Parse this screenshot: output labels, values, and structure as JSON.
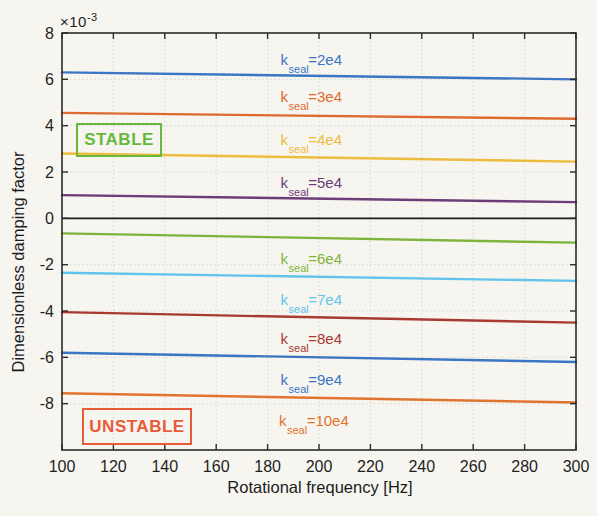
{
  "figure": {
    "background": "#f6f5f0"
  },
  "chart_data": {
    "type": "line",
    "title": "",
    "xlabel": "Rotational frequency [Hz]",
    "ylabel": "Dimensionless damping factor",
    "y_multiplier": {
      "base": "×10",
      "exp": "-3"
    },
    "y_units_note": "all y values are ×10^-3",
    "xlim": [
      100,
      300
    ],
    "ylim": [
      -10,
      8
    ],
    "xticks": [
      100,
      120,
      140,
      160,
      180,
      200,
      220,
      240,
      260,
      280,
      300
    ],
    "yticks": [
      -8,
      -6,
      -4,
      -2,
      0,
      2,
      4,
      6,
      8
    ],
    "grid": true,
    "legend_position": "inline-labels",
    "axis_color": "#2b2b2b",
    "grid_color": "#d7d5cf",
    "zero_line_color": "#1e1e1e",
    "series": [
      {
        "name": "k_seal=2e4",
        "color": "#3a76c4",
        "x": [
          100,
          300
        ],
        "y": [
          6.3,
          6.0
        ],
        "label": {
          "pre": "k",
          "sub": "seal",
          "post": "=2e4"
        },
        "label_x": 197,
        "label_y": 6.8
      },
      {
        "name": "k_seal=3e4",
        "color": "#dd6a2f",
        "x": [
          100,
          300
        ],
        "y": [
          4.55,
          4.3
        ],
        "label": {
          "pre": "k",
          "sub": "seal",
          "post": "=3e4"
        },
        "label_x": 197,
        "label_y": 5.2
      },
      {
        "name": "k_seal=4e4",
        "color": "#edbc3e",
        "x": [
          100,
          300
        ],
        "y": [
          2.8,
          2.45
        ],
        "label": {
          "pre": "k",
          "sub": "seal",
          "post": "=4e4"
        },
        "label_x": 197,
        "label_y": 3.35
      },
      {
        "name": "k_seal=5e4",
        "color": "#6d3d78",
        "x": [
          100,
          300
        ],
        "y": [
          1.0,
          0.7
        ],
        "label": {
          "pre": "k",
          "sub": "seal",
          "post": "=5e4"
        },
        "label_x": 197,
        "label_y": 1.5
      },
      {
        "name": "k_seal=6e4",
        "color": "#7fb43c",
        "x": [
          100,
          300
        ],
        "y": [
          -0.65,
          -1.05
        ],
        "label": {
          "pre": "k",
          "sub": "seal",
          "post": "=6e4"
        },
        "label_x": 197,
        "label_y": -1.8
      },
      {
        "name": "k_seal=7e4",
        "color": "#62c4ea",
        "x": [
          100,
          300
        ],
        "y": [
          -2.35,
          -2.7
        ],
        "label": {
          "pre": "k",
          "sub": "seal",
          "post": "=7e4"
        },
        "label_x": 197,
        "label_y": -3.55
      },
      {
        "name": "k_seal=8e4",
        "color": "#a83a30",
        "x": [
          100,
          300
        ],
        "y": [
          -4.05,
          -4.5
        ],
        "label": {
          "pre": "k",
          "sub": "seal",
          "post": "=8e4"
        },
        "label_x": 197,
        "label_y": -5.25
      },
      {
        "name": "k_seal=9e4",
        "color": "#3a76c4",
        "x": [
          100,
          300
        ],
        "y": [
          -5.8,
          -6.2
        ],
        "label": {
          "pre": "k",
          "sub": "seal",
          "post": "=9e4"
        },
        "label_x": 197,
        "label_y": -7.0
      },
      {
        "name": "k_seal=10e4",
        "color": "#e0742f",
        "x": [
          100,
          300
        ],
        "y": [
          -7.55,
          -7.95
        ],
        "label": {
          "pre": "k",
          "sub": "seal",
          "post": "=10e4"
        },
        "label_x": 198,
        "label_y": -8.8
      }
    ],
    "annotations": [
      {
        "id": "stable",
        "text": "STABLE",
        "color": "#67b93e"
      },
      {
        "id": "unstable",
        "text": "UNSTABLE",
        "color": "#e85b38"
      }
    ]
  }
}
